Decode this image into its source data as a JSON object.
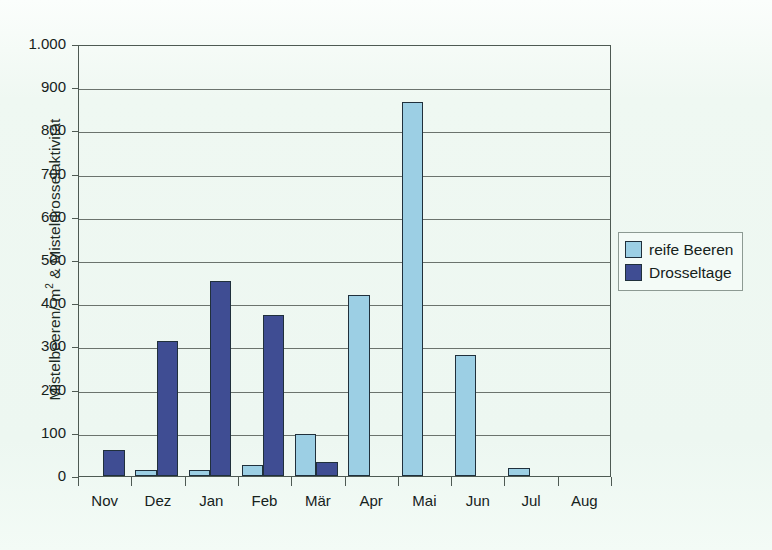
{
  "chart_data": {
    "type": "bar",
    "title": "",
    "subtitle": "",
    "xlabel": "",
    "ylabel": "Mistelbeeren/ m 2 & Misteldrosselaktivität",
    "ylabel_parts": {
      "pre": "Mistelbeeren/ m",
      "sup": "2",
      "post": " & Misteldrosselaktivität"
    },
    "categories": [
      "Nov",
      "Dez",
      "Jan",
      "Feb",
      "Mär",
      "Apr",
      "Mai",
      "Jun",
      "Jul",
      "Aug"
    ],
    "series": [
      {
        "name": "reife Beeren",
        "color": "#9ccfe4",
        "values": [
          0,
          13,
          15,
          25,
          97,
          420,
          865,
          280,
          18,
          0
        ]
      },
      {
        "name": "Drosseltage",
        "color": "#3f4d93",
        "values": [
          60,
          312,
          452,
          372,
          33,
          0,
          0,
          0,
          0,
          0
        ]
      }
    ],
    "ylim": [
      0,
      1000
    ],
    "yticks": [
      0,
      100,
      200,
      300,
      400,
      500,
      600,
      700,
      800,
      900,
      1000
    ],
    "ytick_labels": [
      "0",
      "100",
      "200",
      "300",
      "400",
      "500",
      "600",
      "700",
      "800",
      "900",
      "1.000"
    ],
    "grid": true,
    "legend_position": "right",
    "legend": [
      {
        "label": "reife Beeren",
        "color": "#9ccfe4"
      },
      {
        "label": "Drosseltage",
        "color": "#3f4d93"
      }
    ],
    "colors": {
      "background": "#eff8f2",
      "axis": "#4e5a53",
      "grid": "#6b736d",
      "bar_outline": "#20303c",
      "light_blue": "#9ccfe4",
      "dark_blue": "#3f4d93",
      "text": "#16221c"
    }
  }
}
